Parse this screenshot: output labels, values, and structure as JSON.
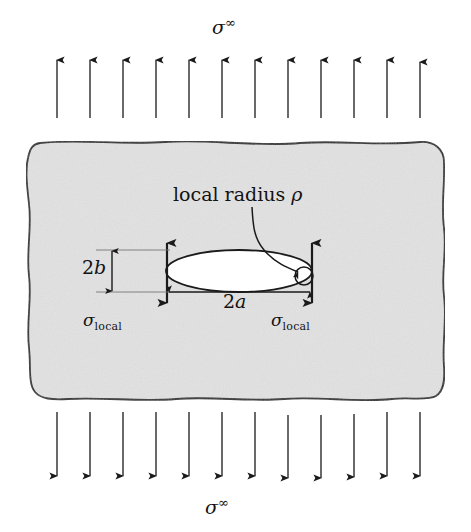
{
  "figure": {
    "title_top": "sigma-infinity",
    "background_color": "#ffffff",
    "plate_fill": "#e2e2e2",
    "plate_stroke": "#2b2b2b",
    "hole_fill": "#ffffff",
    "line_color": "#1a1a1a"
  },
  "labels": {
    "far_field_stress_symbol": "σ",
    "far_field_stress_superscript": "∞",
    "local_stress_symbol": "σ",
    "local_stress_subscript": "local",
    "minor_axis": "2",
    "minor_axis_var": "b",
    "major_axis": "2",
    "major_axis_var": "a",
    "local_radius_text": "local radius ",
    "local_radius_symbol": "ρ"
  },
  "geometry": {
    "plate": {
      "x": 25,
      "y": 142,
      "width": 420,
      "height": 258
    },
    "ellipse": {
      "cx": 239,
      "cy": 271,
      "rx": 73,
      "ry": 21
    },
    "tip_circle": {
      "cx": 305,
      "cy": 275,
      "r": 9
    },
    "top_arrows_count": 12,
    "bottom_arrows_count": 12,
    "arrow_first_x": 57,
    "arrow_spacing": 33,
    "top_arrow_y_start": 118,
    "top_arrow_y_end": 58,
    "bottom_arrow_y_start": 412,
    "bottom_arrow_y_end": 478,
    "local_arrow_left_x": 167,
    "local_arrow_right_x": 312,
    "local_arrow_top_y": 240,
    "local_arrow_bottom_y": 305
  }
}
